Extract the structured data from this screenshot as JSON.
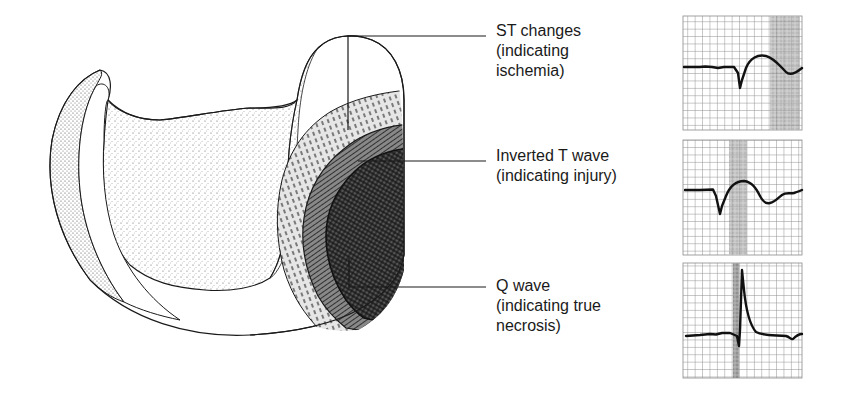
{
  "diagram": {
    "zones": [
      {
        "id": "ischemia",
        "title": "ST changes",
        "lines": [
          "(indicating",
          "ischemia)"
        ],
        "ecg": "st-changes",
        "highlight": "ST segment / T region"
      },
      {
        "id": "injury",
        "title": "Inverted T wave",
        "lines": [
          "(indicating injury)"
        ],
        "ecg": "inverted-t-wave",
        "highlight": "ST segment"
      },
      {
        "id": "necrosis",
        "title": "Q wave",
        "lines": [
          "(indicating true",
          "necrosis)"
        ],
        "ecg": "q-wave",
        "highlight": "Q wave"
      }
    ],
    "colors": {
      "ink": "#1a1a1a",
      "grid": "#8a8a8a",
      "highlight": "#9a9a9a",
      "background": "#ffffff"
    }
  }
}
